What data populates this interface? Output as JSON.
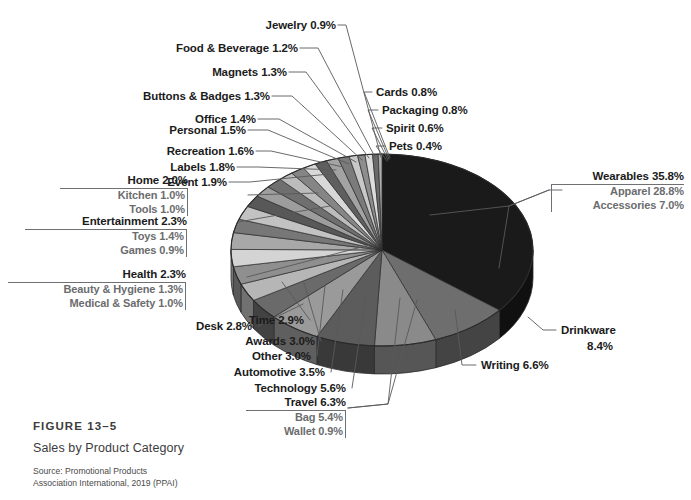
{
  "figure": {
    "number": "FIGURE 13–5",
    "title": "Sales by Product Category",
    "source_line1": "Source: Promotional Products",
    "source_line2": "Association International, 2019 (PPAI)"
  },
  "colors": {
    "background": "#ffffff",
    "text": "#1b1b1b",
    "subtext": "#6b6c6e",
    "leader": "#6f7072",
    "largest_slice": "#1a1a1a"
  },
  "labels": {
    "jewelry": "Jewelry 0.9%",
    "food_beverage": "Food & Beverage 1.2%",
    "magnets": "Magnets 1.3%",
    "buttons_badges": "Buttons & Badges 1.3%",
    "office": "Office 1.4%",
    "personal": "Personal 1.5%",
    "recreation": "Recreation 1.6%",
    "labels_cat": "Labels 1.8%",
    "event": "Event 1.9%",
    "cards": "Cards 0.8%",
    "packaging": "Packaging 0.8%",
    "spirit": "Spirit 0.6%",
    "pets": "Pets 0.4%",
    "desk": "Desk 2.8%",
    "time": "Time 2.9%",
    "awards": "Awards 3.0%",
    "other": "Other 3.0%",
    "automotive": "Automotive 3.5%",
    "technology": "Technology 5.6%",
    "writing": "Writing 6.6%",
    "drinkware_name": "Drinkware",
    "drinkware_pct": "8.4%"
  },
  "groups": {
    "wearables": {
      "head": "Wearables 35.8%",
      "subs": [
        "Apparel 28.8%",
        "Accessories 7.0%"
      ]
    },
    "home": {
      "head": "Home 2.0%",
      "subs": [
        "Kitchen 1.0%",
        "Tools 1.0%"
      ]
    },
    "entertainment": {
      "head": "Entertainment 2.3%",
      "subs": [
        "Toys 1.4%",
        "Games 0.9%"
      ]
    },
    "health": {
      "head": "Health 2.3%",
      "subs": [
        "Beauty & Hygiene 1.3%",
        "Medical & Safety 1.0%"
      ]
    },
    "travel": {
      "head": "Travel 6.3%",
      "subs": [
        "Bag 5.4%",
        "Wallet 0.9%"
      ]
    }
  },
  "chart_data": {
    "type": "pie",
    "title": "Sales by Product Category",
    "subtitle": "FIGURE 13–5",
    "source": "Promotional Products Association International, 2019 (PPAI)",
    "units": "percent of sales",
    "legend": "none — direct labels with leader lines",
    "three_d": true,
    "start_angle_deg": 0,
    "direction": "clockwise",
    "labels": [
      "Wearables",
      "Drinkware",
      "Writing",
      "Travel",
      "Technology",
      "Automotive",
      "Other",
      "Awards",
      "Time",
      "Desk",
      "Health",
      "Entertainment",
      "Home",
      "Event",
      "Labels",
      "Recreation",
      "Personal",
      "Office",
      "Buttons & Badges",
      "Magnets",
      "Food & Beverage",
      "Jewelry",
      "Cards",
      "Packaging",
      "Spirit",
      "Pets"
    ],
    "values": [
      35.8,
      8.4,
      6.6,
      6.3,
      5.6,
      3.5,
      3.0,
      3.0,
      2.9,
      2.8,
      2.3,
      2.3,
      2.0,
      1.9,
      1.8,
      1.6,
      1.5,
      1.4,
      1.3,
      1.3,
      1.2,
      0.9,
      0.8,
      0.8,
      0.6,
      0.4
    ],
    "slice_colors": [
      "#1a1a1a",
      "#6e6e6e",
      "#8a8a8a",
      "#5c5c5c",
      "#9a9a9a",
      "#6a6a6a",
      "#b6b6b6",
      "#8f8f8f",
      "#d4d4d4",
      "#a8a8a8",
      "#777777",
      "#c2c2c2",
      "#585858",
      "#9d9d9d",
      "#6f6f6f",
      "#bcbcbc",
      "#858585",
      "#d8d8d8",
      "#5f5f5f",
      "#a3a3a3",
      "#7b7b7b",
      "#c8c8c8",
      "#8d8d8d",
      "#dcdcdc",
      "#6b6b6b",
      "#aeaeae"
    ],
    "subcategories": {
      "Wearables": [
        {
          "name": "Apparel",
          "value": 28.8
        },
        {
          "name": "Accessories",
          "value": 7.0
        }
      ],
      "Travel": [
        {
          "name": "Bag",
          "value": 5.4
        },
        {
          "name": "Wallet",
          "value": 0.9
        }
      ],
      "Health": [
        {
          "name": "Beauty & Hygiene",
          "value": 1.3
        },
        {
          "name": "Medical & Safety",
          "value": 1.0
        }
      ],
      "Entertainment": [
        {
          "name": "Toys",
          "value": 1.4
        },
        {
          "name": "Games",
          "value": 0.9
        }
      ],
      "Home": [
        {
          "name": "Kitchen",
          "value": 1.0
        },
        {
          "name": "Tools",
          "value": 1.0
        }
      ]
    }
  }
}
